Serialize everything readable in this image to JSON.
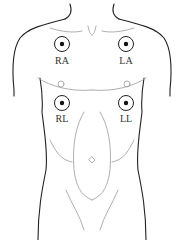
{
  "diagram": {
    "electrodes": [
      {
        "id": "RA",
        "label": "RA",
        "meaning": "Right Arm",
        "cx": 62,
        "cy": 44
      },
      {
        "id": "LA",
        "label": "LA",
        "meaning": "Left Arm",
        "cx": 126,
        "cy": 44
      },
      {
        "id": "RL",
        "label": "RL",
        "meaning": "Right Leg",
        "cx": 62,
        "cy": 103
      },
      {
        "id": "LL",
        "label": "LL",
        "meaning": "Left Leg",
        "cx": 126,
        "cy": 103
      }
    ],
    "colors": {
      "outline": "#222222",
      "muscle_lines": "#9a9a9a",
      "electrode_dot": "#111111",
      "background": "#ffffff"
    }
  }
}
